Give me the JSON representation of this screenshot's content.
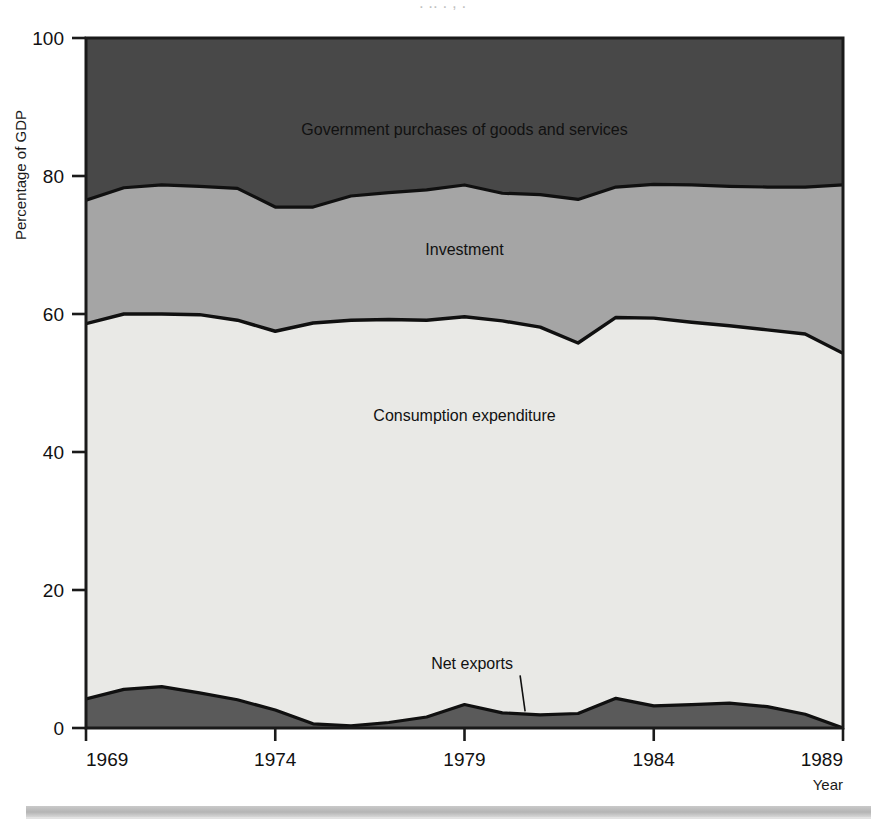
{
  "figure": {
    "top_crop_artifact": ".  ..  .    ,      .",
    "background_color": "#ffffff"
  },
  "axes": {
    "y_axis_title": "Percentage of GDP",
    "x_axis_title": "Year",
    "y_ticks": [
      "0",
      "20",
      "40",
      "60",
      "80",
      "100"
    ],
    "x_ticks": [
      "1969",
      "1974",
      "1979",
      "1984",
      "1989"
    ]
  },
  "colors": {
    "government": "#484848",
    "investment": "#a5a5a5",
    "consumption": "#e9e9e6",
    "net_exports": "#5a5a5a",
    "outline": "#101010",
    "frame": "#1a1a1a",
    "bottom_rule": "#bfbfbf"
  },
  "labels": {
    "government": "Government purchases of goods and services",
    "investment": "Investment",
    "consumption": "Consumption expenditure",
    "net_exports": "Net exports"
  },
  "chart_data": {
    "type": "area",
    "title": "",
    "subtitle": "",
    "xlabel": "Year",
    "ylabel": "Percentage of GDP",
    "xlim": [
      1969,
      1989
    ],
    "ylim": [
      0,
      100
    ],
    "grid": false,
    "stacked": true,
    "legend": "inline-labels",
    "x": [
      1969,
      1970,
      1971,
      1972,
      1973,
      1974,
      1975,
      1976,
      1977,
      1978,
      1979,
      1980,
      1981,
      1982,
      1983,
      1984,
      1985,
      1986,
      1987,
      1988,
      1989
    ],
    "series": [
      {
        "name": "Net exports",
        "values": [
          4.2,
          5.6,
          6.0,
          5.1,
          4.1,
          2.6,
          0.6,
          0.3,
          0.8,
          1.6,
          3.4,
          2.2,
          1.9,
          2.1,
          4.3,
          3.2,
          3.4,
          3.6,
          3.1,
          2.0,
          0.0
        ],
        "cumulative_top": [
          4.2,
          5.6,
          6.0,
          5.1,
          4.1,
          2.6,
          0.6,
          0.3,
          0.8,
          1.6,
          3.4,
          2.2,
          1.9,
          2.1,
          4.3,
          3.2,
          3.4,
          3.6,
          3.1,
          2.0,
          0.0
        ]
      },
      {
        "name": "Consumption expenditure",
        "values": [
          54.4,
          54.4,
          54.0,
          54.8,
          55.0,
          54.9,
          58.1,
          58.8,
          58.4,
          57.5,
          56.2,
          56.8,
          56.2,
          53.7,
          55.2,
          56.2,
          55.4,
          54.7,
          54.6,
          55.1,
          54.3
        ],
        "cumulative_top": [
          58.6,
          60.0,
          60.0,
          59.9,
          59.1,
          57.5,
          58.7,
          59.1,
          59.2,
          59.1,
          59.6,
          59.0,
          58.1,
          55.8,
          59.5,
          59.4,
          58.8,
          58.3,
          57.7,
          57.1,
          54.3
        ]
      },
      {
        "name": "Investment",
        "values": [
          17.9,
          18.3,
          18.7,
          18.6,
          19.1,
          18.0,
          16.8,
          18.0,
          18.4,
          18.9,
          19.1,
          18.5,
          19.2,
          20.8,
          18.9,
          19.4,
          19.9,
          20.2,
          20.7,
          21.3,
          24.4
        ],
        "cumulative_top": [
          76.5,
          78.3,
          78.7,
          78.5,
          78.2,
          75.5,
          75.5,
          77.1,
          77.6,
          78.0,
          78.7,
          77.5,
          77.3,
          76.6,
          78.4,
          78.8,
          78.7,
          78.5,
          78.4,
          78.4,
          78.7
        ]
      },
      {
        "name": "Government purchases of goods and services",
        "values": [
          23.5,
          21.7,
          21.3,
          21.5,
          21.8,
          24.5,
          24.5,
          22.9,
          22.4,
          22.0,
          21.3,
          22.5,
          22.7,
          23.4,
          21.6,
          21.2,
          21.3,
          21.5,
          21.6,
          21.6,
          21.3
        ],
        "cumulative_top": [
          100,
          100,
          100,
          100,
          100,
          100,
          100,
          100,
          100,
          100,
          100,
          100,
          100,
          100,
          100,
          100,
          100,
          100,
          100,
          100,
          100
        ]
      }
    ],
    "annotations": [
      {
        "text": "Government purchases of goods and services",
        "x": 1979,
        "y": 86
      },
      {
        "text": "Investment",
        "x": 1979,
        "y": 68.5
      },
      {
        "text": "Consumption expenditure",
        "x": 1979,
        "y": 44.5
      },
      {
        "text": "Net exports",
        "x": 1979.2,
        "y": 8.5,
        "leader_to": {
          "x": 1980.6,
          "y": 2.4
        }
      }
    ]
  }
}
